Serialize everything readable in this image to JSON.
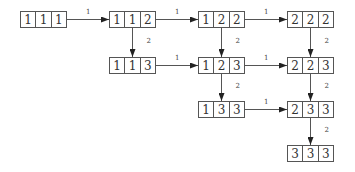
{
  "nodes": [
    {
      "id": "n111",
      "cells": [
        "1",
        "1",
        "1"
      ],
      "x": 20,
      "y": 11
    },
    {
      "id": "n112",
      "cells": [
        "1",
        "1",
        "2"
      ],
      "x": 109,
      "y": 11
    },
    {
      "id": "n122",
      "cells": [
        "1",
        "2",
        "2"
      ],
      "x": 198,
      "y": 11
    },
    {
      "id": "n222",
      "cells": [
        "2",
        "2",
        "2"
      ],
      "x": 287,
      "y": 11
    },
    {
      "id": "n113",
      "cells": [
        "1",
        "1",
        "3"
      ],
      "x": 109,
      "y": 57
    },
    {
      "id": "n123",
      "cells": [
        "1",
        "2",
        "3"
      ],
      "x": 198,
      "y": 57
    },
    {
      "id": "n223",
      "cells": [
        "2",
        "2",
        "3"
      ],
      "x": 287,
      "y": 57
    },
    {
      "id": "n133",
      "cells": [
        "1",
        "3",
        "3"
      ],
      "x": 198,
      "y": 101
    },
    {
      "id": "n233",
      "cells": [
        "2",
        "3",
        "3"
      ],
      "x": 287,
      "y": 101
    },
    {
      "id": "n333",
      "cells": [
        "3",
        "3",
        "3"
      ],
      "x": 287,
      "y": 145
    }
  ],
  "edges": [
    {
      "from": "n111",
      "to": "n112",
      "label": "1",
      "dir": "h"
    },
    {
      "from": "n112",
      "to": "n122",
      "label": "1",
      "dir": "h"
    },
    {
      "from": "n122",
      "to": "n222",
      "label": "1",
      "dir": "h"
    },
    {
      "from": "n113",
      "to": "n123",
      "label": "1",
      "dir": "h"
    },
    {
      "from": "n123",
      "to": "n223",
      "label": "1",
      "dir": "h"
    },
    {
      "from": "n133",
      "to": "n233",
      "label": "1",
      "dir": "h"
    },
    {
      "from": "n112",
      "to": "n113",
      "label": "2",
      "dir": "v"
    },
    {
      "from": "n122",
      "to": "n123",
      "label": "2",
      "dir": "v"
    },
    {
      "from": "n222",
      "to": "n223",
      "label": "2",
      "dir": "v"
    },
    {
      "from": "n123",
      "to": "n133",
      "label": "2",
      "dir": "v"
    },
    {
      "from": "n223",
      "to": "n233",
      "label": "2",
      "dir": "v"
    },
    {
      "from": "n233",
      "to": "n333",
      "label": "2",
      "dir": "v"
    }
  ],
  "colors": {
    "line": "#555555",
    "text": "#333333"
  }
}
